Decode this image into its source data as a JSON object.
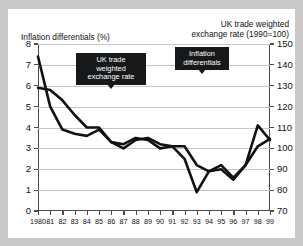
{
  "figure": {
    "left_axis_caption": "Inflation differentials (%)",
    "right_axis_caption_line1": "UK trade weighted",
    "right_axis_caption_line2": "exchange rate (1990=100)",
    "callout_exchange": "UK trade\nweighted\nexchange rate",
    "callout_inflation": "Inflation\ndifferentials",
    "line_color": "#111111",
    "grid_color": "#c6c6c6",
    "axis_color": "#4c4c4c",
    "callout_bg": "#17181a",
    "callout_fg": "#ffffff",
    "page_bg": "#c9c9c9",
    "figure_bg": "#ffffff"
  },
  "chart_data": {
    "type": "line",
    "title": "",
    "xlabel": "",
    "grid": true,
    "legend": "annotated-callouts",
    "x": [
      1980,
      1981,
      1982,
      1983,
      1984,
      1985,
      1986,
      1987,
      1988,
      1989,
      1990,
      1991,
      1992,
      1993,
      1994,
      1995,
      1996,
      1997,
      1998,
      1999
    ],
    "xtick_labels": [
      "1980",
      "81",
      "82",
      "83",
      "84",
      "85",
      "86",
      "87",
      "88",
      "89",
      "90",
      "91",
      "92",
      "93",
      "94",
      "95",
      "96",
      "97",
      "98",
      "99"
    ],
    "left_axis": {
      "label": "Inflation differentials (%)",
      "ylim": [
        0,
        8
      ],
      "ticks": [
        0,
        1,
        2,
        3,
        4,
        5,
        6,
        7,
        8
      ]
    },
    "right_axis": {
      "label": "UK trade weighted exchange rate (1990=100)",
      "ylim": [
        70,
        150
      ],
      "ticks": [
        70,
        80,
        90,
        100,
        110,
        120,
        130,
        140,
        150
      ]
    },
    "series": [
      {
        "name": "Inflation differentials",
        "axis": "left",
        "unit": "%",
        "values": [
          7.4,
          5.0,
          3.9,
          3.7,
          3.6,
          3.9,
          3.3,
          3.0,
          3.4,
          3.5,
          3.2,
          3.1,
          3.1,
          2.2,
          1.9,
          2.2,
          1.6,
          2.2,
          3.1,
          3.45
        ]
      },
      {
        "name": "UK trade weighted exchange rate",
        "axis": "right",
        "unit": "1990=100",
        "values": [
          129,
          128,
          123,
          116,
          110,
          110,
          103,
          102,
          105,
          104,
          100,
          101,
          95,
          79,
          89,
          90,
          85,
          92,
          111,
          104
        ],
        "values_on_left_scale": [
          5.9,
          5.8,
          5.3,
          4.6,
          4.0,
          4.0,
          3.3,
          3.2,
          3.5,
          3.4,
          3.0,
          3.1,
          2.5,
          0.9,
          1.9,
          2.0,
          1.5,
          2.2,
          4.1,
          3.4
        ]
      }
    ]
  }
}
